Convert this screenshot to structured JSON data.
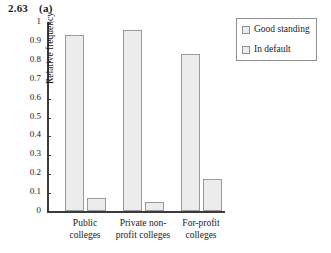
{
  "figure": {
    "number": "2.63",
    "part": "(a)"
  },
  "chart_data": {
    "type": "bar",
    "xlabel": "",
    "ylabel": "Relative frequency",
    "ylim": [
      0,
      1
    ],
    "yticks": [
      "0",
      "0.1",
      "0.2",
      "0.3",
      "0.4",
      "0.5",
      "0.6",
      "0.7",
      "0.8",
      "0.9",
      "1"
    ],
    "grid": false,
    "legend_position": "top-right",
    "categories": [
      "Public colleges",
      "Private non-profit colleges",
      "For-profit colleges"
    ],
    "series": [
      {
        "name": "Good standing",
        "values": [
          0.93,
          0.96,
          0.83
        ],
        "color": "#ececec"
      },
      {
        "name": "In default",
        "values": [
          0.07,
          0.05,
          0.17
        ],
        "color": "#ececec"
      }
    ]
  },
  "category_lines": [
    [
      "Public",
      "colleges"
    ],
    [
      "Private non-",
      "profit colleges"
    ],
    [
      "For-profit",
      "colleges"
    ]
  ],
  "legend": {
    "items": [
      {
        "label": "Good standing",
        "marker": "square-outline"
      },
      {
        "label": "In default",
        "marker": "square-outline"
      }
    ]
  },
  "colors": {
    "bar_fill": "#ececec",
    "bar_stroke": "#9a9a9a",
    "axis": "#3b3b3b",
    "text": "#1a1a1a",
    "background": "#ffffff"
  }
}
